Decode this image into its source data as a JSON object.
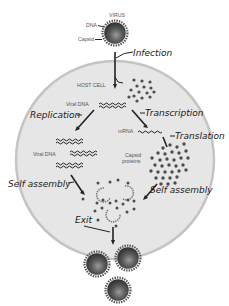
{
  "diagram": {
    "labels": {
      "virus": "VIRUS",
      "dna": "DNA",
      "capsid": "Capsid",
      "host_cell": "HOST CELL",
      "viral_dna_top": "Viral DNA",
      "viral_dna_left": "Viral DNA",
      "mrna": "mRNA",
      "capsid_proteins_line1": "Capsid",
      "capsid_proteins_line2": "proteins"
    },
    "steps": {
      "infection": "Infection",
      "replication": "Replication",
      "transcription": "Transcription",
      "translation": "Translation",
      "self_assembly_left": "Self assembly",
      "self_assembly_right": "Self assembly",
      "exit": "Exit"
    },
    "colors": {
      "cell_fill": "#e6e6e6",
      "cell_border": "#c4c4c4",
      "virus_core": "#4a4a4a",
      "virus_spikes": "#555555",
      "dots": "#4d4d4d",
      "text": "#1a1a1a"
    }
  }
}
